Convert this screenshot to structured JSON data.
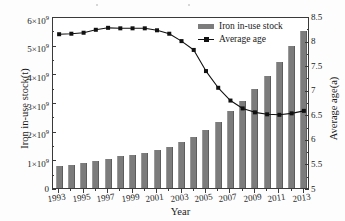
{
  "figure": {
    "title": "",
    "background_color": "#ffffff",
    "bar_color": "#7c7c7c",
    "line_color": "#111111"
  },
  "legend": {
    "position": "top-right",
    "entries": [
      {
        "label": "Iron in-use stock",
        "marker": "bar-swatch",
        "color": "#7c7c7c"
      },
      {
        "label": "Average age",
        "marker": "line-with-square-marker",
        "color": "#111111"
      }
    ]
  },
  "axes": {
    "x": {
      "label": "Year",
      "tick_labels": [
        "1993",
        "1995",
        "1997",
        "1999",
        "2001",
        "2003",
        "2005",
        "2007",
        "2009",
        "2011",
        "2013"
      ],
      "range": [
        1992.5,
        2013.5
      ],
      "minor_ticks": true
    },
    "y_left": {
      "label": "Iron in-use stock(t)",
      "tick_labels": [
        "0",
        "1×10⁹",
        "2×10⁹",
        "3×10⁹",
        "4×10⁹",
        "5×10⁹",
        "6×10⁹"
      ],
      "tick_values": [
        0,
        1000000000,
        2000000000,
        3000000000,
        4000000000,
        5000000000,
        6000000000
      ],
      "range": [
        0,
        6000000000
      ]
    },
    "y_right": {
      "label": "Average age(a)",
      "tick_labels": [
        "5",
        "5.5",
        "6",
        "6.5",
        "7",
        "7.5",
        "8",
        "8.5"
      ],
      "tick_values": [
        5,
        5.5,
        6,
        6.5,
        7,
        7.5,
        8,
        8.5
      ],
      "range": [
        5,
        8.5
      ]
    }
  },
  "chart_data": {
    "type": "bar",
    "title": "",
    "xlabel": "Year",
    "ylabel": "Iron in-use stock(t)",
    "ylabel_secondary": "Average age(a)",
    "grid": false,
    "legend_position": "top-right",
    "categories": [
      "1993",
      "1994",
      "1995",
      "1996",
      "1997",
      "1998",
      "1999",
      "2000",
      "2001",
      "2002",
      "2003",
      "2004",
      "2005",
      "2006",
      "2007",
      "2008",
      "2009",
      "2010",
      "2011",
      "2012",
      "2013"
    ],
    "ylim": [
      0,
      6000000000
    ],
    "ylim_secondary": [
      5,
      8.5
    ],
    "series": [
      {
        "name": "Iron in-use stock",
        "type": "bar",
        "axis": "left",
        "unit": "t",
        "color": "#7c7c7c",
        "values": [
          780000000,
          820000000,
          890000000,
          950000000,
          1020000000,
          1100000000,
          1160000000,
          1230000000,
          1320000000,
          1440000000,
          1600000000,
          1780000000,
          2020000000,
          2320000000,
          2680000000,
          3040000000,
          3460000000,
          3920000000,
          4400000000,
          4940000000,
          5480000000
        ]
      },
      {
        "name": "Average age",
        "type": "line",
        "axis": "right",
        "unit": "a",
        "color": "#111111",
        "marker": "square",
        "values": [
          8.17,
          8.18,
          8.2,
          8.26,
          8.3,
          8.29,
          8.29,
          8.29,
          8.25,
          8.18,
          8.03,
          7.85,
          7.42,
          7.08,
          6.82,
          6.66,
          6.58,
          6.54,
          6.53,
          6.56,
          6.61
        ]
      }
    ]
  }
}
